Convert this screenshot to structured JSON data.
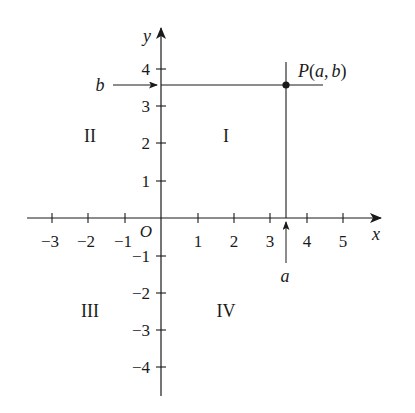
{
  "diagram": {
    "type": "cartesian-coordinate-plane",
    "axes": {
      "x_label": "x",
      "y_label": "y",
      "origin_label": "O",
      "x_ticks": [
        "−3",
        "−2",
        "−1",
        "1",
        "2",
        "3",
        "4",
        "5"
      ],
      "y_ticks": [
        "4",
        "3",
        "2",
        "1",
        "−1",
        "−2",
        "−3",
        "−4"
      ]
    },
    "point": {
      "label": "P(a, b)",
      "label_parts": {
        "name": "P",
        "open": "(",
        "a": "a",
        "comma": ",",
        "b": "b",
        "close": ")"
      },
      "x": 3.4,
      "y": 3.6
    },
    "markers": {
      "a_label": "a",
      "b_label": "b"
    },
    "quadrants": {
      "I": "I",
      "II": "II",
      "III": "III",
      "IV": "IV"
    },
    "colors": {
      "ink": "#1a1a1a",
      "background": "#ffffff"
    }
  }
}
